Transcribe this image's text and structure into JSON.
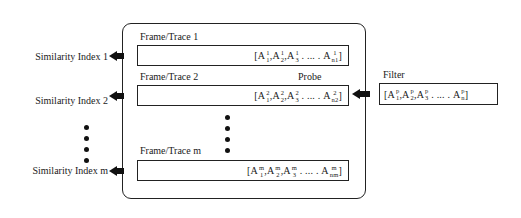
{
  "diagram": {
    "similarity_indices": [
      {
        "label": "Similarity Index 1"
      },
      {
        "label": "Similarity Index 2"
      },
      {
        "label": "Similarity Index m"
      }
    ],
    "frames": [
      {
        "label": "Frame/Trace 1",
        "sequence": "[A¹₁, A¹₂, A¹₃, ...., A¹n₁]",
        "superscript": "1",
        "last_subscript": "n1",
        "tag": ""
      },
      {
        "label": "Frame/Trace 2",
        "sequence": "[A²₁, A²₂, A²₃, ...., A²n₂]",
        "superscript": "2",
        "last_subscript": "n2",
        "tag": "Probe"
      },
      {
        "label": "Frame/Trace m",
        "sequence": "[Aᵐ₁, Aᵐ₂, Aᵐ₃, ...., Aᵐnₘ]",
        "superscript": "m",
        "last_subscript": "nm",
        "tag": ""
      }
    ],
    "filter": {
      "label": "Filter",
      "sequence": "[Aᵖ₁, Aᵖ₂, Aᵖ₃, ...., Aᵖn]",
      "superscript": "p",
      "last_subscript": "n"
    },
    "ellipsis": "⋮",
    "seq_parts": {
      "A": "A",
      "open": "[",
      "close": "]",
      "comma": ",",
      "dots": ". ... ."
    },
    "subs": {
      "s1": "1",
      "s2": "2",
      "s3": "3"
    }
  }
}
